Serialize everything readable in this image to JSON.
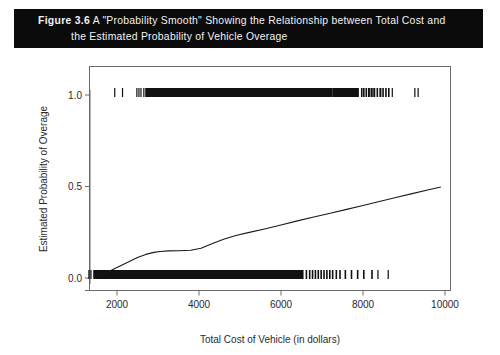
{
  "caption": {
    "figure_number": "Figure 3.6",
    "line1": "A \"Probability Smooth\" Showing the Relationship between Total Cost and",
    "line2": "the Estimated Probability of Vehicle Overage",
    "background_color": "#0b0b0b",
    "text_color": "#f2f2f2"
  },
  "chart_data": {
    "type": "line",
    "title": "",
    "xlabel": "Total Cost of Vehicle (in dollars)",
    "ylabel": "Estimated Probability of Overage",
    "xlim": [
      1200,
      10400
    ],
    "ylim": [
      -0.04,
      1.1
    ],
    "xticks": [
      2000,
      4000,
      6000,
      8000,
      10000
    ],
    "xtick_labels": [
      "2000",
      "4000",
      "6000",
      "8000",
      "10000"
    ],
    "yticks": [
      0.0,
      0.5,
      1.0
    ],
    "ytick_labels": [
      "0.0",
      "0.5",
      "1.0"
    ],
    "grid": false,
    "legend": "none",
    "box_frame": true,
    "line_color": "#1a1a1a",
    "series": [
      {
        "name": "probability smooth",
        "x": [
          1480,
          1600,
          1750,
          1900,
          2100,
          2300,
          2500,
          2700,
          2900,
          3050,
          3250,
          3500,
          3800,
          4050,
          4300,
          4600,
          4900,
          5200,
          5600,
          6000,
          6400,
          6800,
          7200,
          7600,
          8000,
          8400,
          8800,
          9200,
          9600,
          9900
        ],
        "y": [
          0.012,
          0.018,
          0.03,
          0.047,
          0.068,
          0.09,
          0.112,
          0.129,
          0.14,
          0.145,
          0.148,
          0.149,
          0.152,
          0.163,
          0.186,
          0.212,
          0.232,
          0.248,
          0.268,
          0.29,
          0.312,
          0.333,
          0.354,
          0.375,
          0.396,
          0.418,
          0.44,
          0.461,
          0.482,
          0.497
        ]
      }
    ],
    "rug_top": {
      "value": 1.0,
      "description": "dense rug of observations at probability 1.0",
      "sparse_marks": [
        1930,
        2120,
        2470,
        2520,
        2570,
        2640,
        2690,
        8150,
        8230,
        8420,
        8700,
        9250,
        9330
      ],
      "dense_bands": [
        [
          2700,
          7250
        ],
        [
          7250,
          7900
        ]
      ],
      "medium_marks": [
        7950,
        8000,
        8060,
        8120,
        8190,
        8260,
        8330,
        8400,
        8470,
        8540,
        8610
      ]
    },
    "rug_bottom": {
      "value": 0.0,
      "description": "dense rug of observations at probability 0.0",
      "dense_bands": [
        [
          1420,
          6550
        ]
      ],
      "medium_marks": [
        6600,
        6680,
        6750,
        6820,
        6890,
        6960,
        7030,
        7100,
        7170,
        7240,
        7330,
        7420,
        7550,
        7700,
        7850,
        8000,
        8200
      ],
      "sparse_marks": [
        1300,
        1350,
        8350,
        8600
      ]
    }
  }
}
